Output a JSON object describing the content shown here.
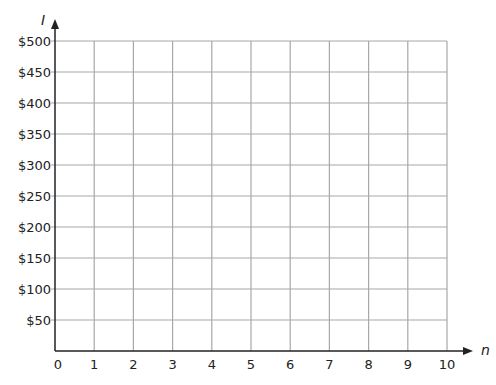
{
  "chart_data": {
    "type": "line",
    "title": "",
    "xlabel": "n",
    "ylabel": "I",
    "x_ticks": [
      "0",
      "1",
      "2",
      "3",
      "4",
      "5",
      "6",
      "7",
      "8",
      "9",
      "10"
    ],
    "y_ticks": [
      "$50",
      "$100",
      "$150",
      "$200",
      "$250",
      "$300",
      "$350",
      "$400",
      "$450",
      "$500"
    ],
    "xlim": [
      0,
      10
    ],
    "ylim": [
      0,
      500
    ],
    "grid": true,
    "series": []
  }
}
